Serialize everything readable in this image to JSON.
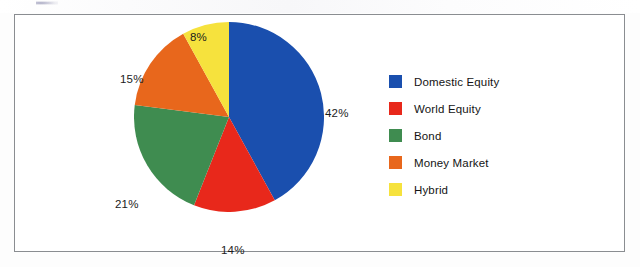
{
  "chart_data": {
    "type": "pie",
    "title": "",
    "categories": [
      "Domestic Equity",
      "World Equity",
      "Bond",
      "Money Market",
      "Hybrid"
    ],
    "values": [
      42,
      14,
      21,
      15,
      8
    ],
    "value_labels": [
      "42%",
      "14%",
      "21%",
      "15%",
      "8%"
    ],
    "colors": [
      "#1A4FAE",
      "#E8281B",
      "#3F8C50",
      "#E8671C",
      "#F6E23D"
    ],
    "units": "percent",
    "total": 100,
    "start_angle_deg": 0,
    "direction": "clockwise",
    "legend_position": "right",
    "grid": false,
    "labels_outside": true
  },
  "legend": {
    "items": [
      {
        "label": "Domestic Equity",
        "color": "#1A4FAE"
      },
      {
        "label": "World Equity",
        "color": "#E8281B"
      },
      {
        "label": "Bond",
        "color": "#3F8C50"
      },
      {
        "label": "Money Market",
        "color": "#E8671C"
      },
      {
        "label": "Hybrid",
        "color": "#F6E23D"
      }
    ]
  },
  "slice_labels": {
    "domestic_equity": "42%",
    "world_equity": "14%",
    "bond": "21%",
    "money_market": "15%",
    "hybrid": "8%"
  },
  "frame": {
    "border_color": "#8a8d91",
    "background": "#ffffff"
  }
}
